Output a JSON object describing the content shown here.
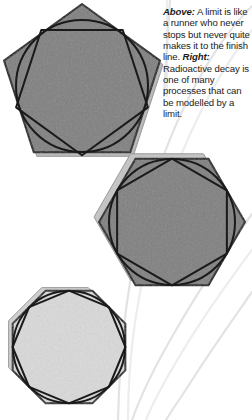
{
  "caption": {
    "part1_lead": "Above:",
    "part1_text": " A limit is like a runner who never stops but never quite makes it to the finish line. ",
    "part2_lead": "Right:",
    "part2_text": " Radioactive decay is one of many processes that can be modelled by a limit."
  },
  "figures": [
    {
      "name": "pentagon-figure",
      "label": "pentagon",
      "sides": 5,
      "center_x": 82,
      "center_y": 86,
      "radius": 82,
      "rotation_deg": -90,
      "fill": "#808080",
      "stroke": "#1a1a1a",
      "inner_polygon_scale": 0.845,
      "inner_polygon_rotation_offset_deg": 36,
      "circle_radius": 66,
      "shadow_offset_x": 3,
      "shadow_offset_y": 4,
      "shadow_fill": "#b9b9b9"
    },
    {
      "name": "hexagon-figure",
      "label": "hexagon",
      "sides": 6,
      "center_x": 172,
      "center_y": 222,
      "radius": 73,
      "rotation_deg": 0,
      "fill": "#808080",
      "stroke": "#1a1a1a",
      "inner_polygon_scale": 0.868,
      "inner_polygon_rotation_offset_deg": 30,
      "circle_radius": 63,
      "shadow_offset_x": -5,
      "shadow_offset_y": -5,
      "shadow_fill": "#c4c4c4"
    },
    {
      "name": "octagon-figure",
      "label": "octagon",
      "sides": 8,
      "center_x": 69,
      "center_y": 347,
      "radius": 61,
      "rotation_deg": 22.5,
      "fill": "#d9d9d9",
      "stroke": "#1a1a1a",
      "inner_polygon_scale": 0.925,
      "inner_polygon_rotation_offset_deg": 22.5,
      "circle_radius": 56,
      "shadow_offset_x": -4,
      "shadow_offset_y": -3,
      "shadow_fill": "#cfcfcf"
    }
  ],
  "decorations": {
    "stroke_color": "#e3e3e3",
    "stroke_color_soft": "#ededed",
    "stroke_width": 2.2,
    "curves": [
      "M 252 6 C 214 44, 176 110, 150 196 C 128 270, 120 340, 118 420",
      "M 252 30 C 218 72, 182 140, 158 220 C 136 292, 128 356, 128 420",
      "M 252 214 C 226 250, 200 288, 176 330 C 156 364, 142 392, 132 420",
      "M 252 250 C 228 282, 204 316, 182 352 C 164 382, 152 404, 146 420",
      "M 252 292 C 234 318, 214 346, 196 374 C 182 396, 172 410, 166 420",
      "M 167 0 L 167 96",
      "M 170 0 C 168 34, 166 66, 164 96"
    ]
  },
  "page": {
    "background": "#ffffff",
    "width": 252,
    "height": 420
  }
}
